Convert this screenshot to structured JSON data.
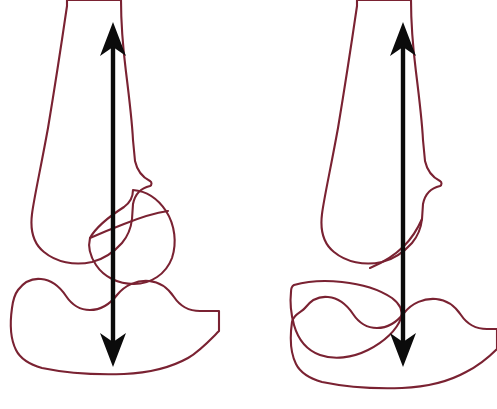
{
  "figure": {
    "background_color": "#ffffff",
    "width": 497,
    "height": 409,
    "panel_count": 2
  },
  "style": {
    "outline_color": "#7a2232",
    "outline_width": 2.1,
    "axis_color": "#0b0b0b",
    "axis_width": 4.4,
    "bone_fill_base": "#faf6f2",
    "bone_band_lavender": "#e6dcea",
    "bone_band_pink": "#f2e2e8",
    "bone_band_cream": "#f7f2e6",
    "bone_band_white": "#fdfbfa"
  },
  "panels": [
    {
      "id": "left-panel",
      "name": "normal-patellar-tracking",
      "label": "Left knee: axis passes through centered patella and tibial plateau",
      "axis": {
        "name": "mechanical-axis-arrow",
        "top_x": 113,
        "top_y": 22,
        "bottom_x": 113,
        "bottom_y": 367,
        "double_headed": true,
        "head_length": 34,
        "head_half_width": 13,
        "head_notch": 9
      },
      "bones": [
        {
          "name": "femur-shaft-and-condyle",
          "role": "femur"
        },
        {
          "name": "patella",
          "role": "patella",
          "position": "centered-articulating"
        },
        {
          "name": "tibia-plateau",
          "role": "tibia"
        }
      ]
    },
    {
      "id": "right-panel",
      "name": "displaced-patella",
      "label": "Right knee: patella displaced away from the axis line",
      "axis": {
        "name": "mechanical-axis-arrow",
        "top_x": 403,
        "top_y": 22,
        "bottom_x": 403,
        "bottom_y": 367,
        "double_headed": true,
        "head_length": 34,
        "head_half_width": 13,
        "head_notch": 9
      },
      "bones": [
        {
          "name": "femur-shaft-and-condyle",
          "role": "femur"
        },
        {
          "name": "patella",
          "role": "patella",
          "position": "displaced-inferolateral"
        },
        {
          "name": "tibia-plateau",
          "role": "tibia"
        }
      ]
    }
  ],
  "shapes": {
    "left_femur": "M 67 0 L 67 6 C 62 40 55 86 48 128 C 40 172 34 198 32 214 C 30 230 34 244 44 252 C 56 262 74 266 92 262 C 104 259 114 252 122 243 C 128 236 131 228 132 219 L 133 204 C 135 194 141 188 150 186 C 152 185 152 182 150 181 C 142 177 137 170 135 161 L 133 140 C 132 120 129 96 126 72 C 123 48 121 22 121 0 Z",
    "left_patella": "M 133 190 C 146 191 158 199 166 211 C 175 225 177 243 172 258 C 166 274 151 284 134 284 C 118 284 104 277 96 265 C 90 256 88 246 90 238 C 96 227 110 216 124 207 C 131 202 133 196 133 190 Z",
    "left_patella_notch": "M 90 238 C 99 234 111 229 124 224 C 139 218 154 213 168 211",
    "left_tibia": "M 18 290 C 24 282 32 278 41 279 C 52 280 60 287 66 296 C 72 305 80 310 90 310 C 101 310 110 304 117 295 C 125 285 137 280 149 281 C 160 282 168 288 174 297 C 180 306 189 311 200 311 L 219 311 L 219 331 C 210 340 200 351 188 358 C 170 368 148 373 124 374 C 96 375 66 373 42 368 C 28 364 20 358 16 350 C 10 338 10 322 12 308 C 13 300 15 294 18 290 Z",
    "right_femur": "M 357 0 L 357 6 C 352 40 345 86 338 128 C 330 172 324 198 322 214 C 320 230 324 244 334 252 C 346 262 364 266 382 262 C 394 259 404 252 412 243 C 418 236 421 228 422 219 L 423 204 C 425 194 431 188 440 186 C 442 185 442 182 440 181 C 432 177 427 170 425 161 L 423 140 C 422 120 419 96 416 72 C 413 48 411 22 411 0 Z",
    "right_femur_condyle_tip": "M 422 219 C 418 228 412 238 404 246 C 394 256 382 263 370 268",
    "right_patella": "M 294 285 C 308 281 325 280 342 282 C 362 284 380 290 392 298 C 400 304 403 311 401 318 C 397 330 384 342 368 350 C 352 358 334 360 320 355 C 306 350 298 339 294 325 C 291 314 290 301 291 292 C 291 288 292 286 294 285 Z",
    "right_tibia": "M 305 308 C 311 300 319 296 328 297 C 339 298 347 305 353 314 C 359 323 367 328 377 328 C 388 328 397 322 404 313 C 412 303 424 298 436 299 C 447 300 455 306 461 315 C 467 324 476 329 487 329 L 497 329 L 497 349 C 488 358 478 366 466 372 C 448 382 426 387 402 388 C 374 389 346 387 322 382 C 308 378 300 372 296 364 C 290 352 290 336 292 322 C 293 314 302 312 305 308 Z"
  }
}
